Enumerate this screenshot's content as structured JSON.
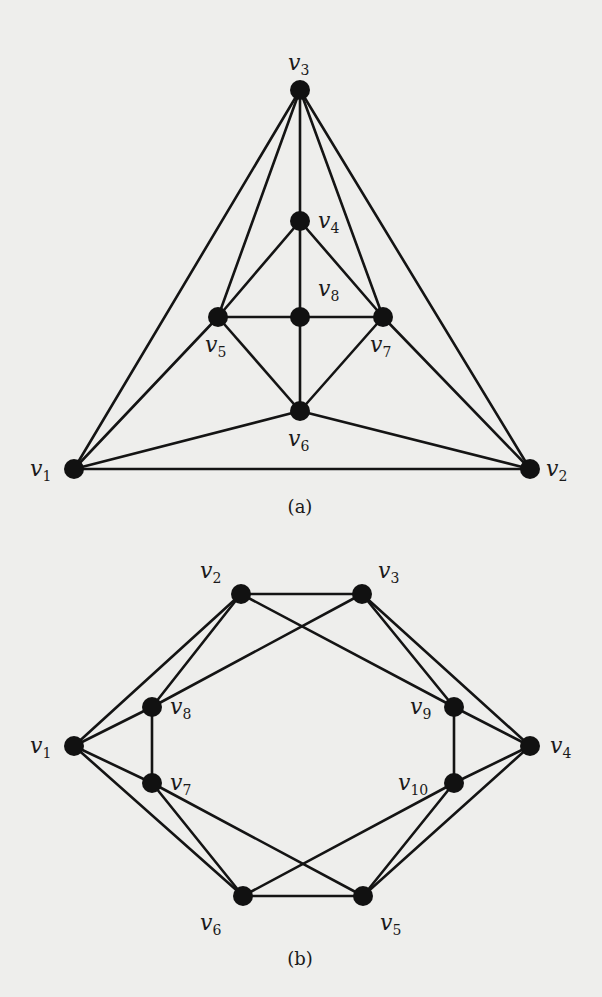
{
  "figure": {
    "background": "#eeeeec",
    "edge_color": "#141414",
    "node_color": "#111111",
    "node_radius": 10
  },
  "graphs": [
    {
      "id": "a",
      "caption": "(a)",
      "caption_pos": [
        300,
        513
      ],
      "nodes": [
        {
          "id": "v1",
          "name": "v",
          "sub": "1",
          "x": 74,
          "y": 469,
          "lx": 30,
          "ly": 476
        },
        {
          "id": "v2",
          "name": "v",
          "sub": "2",
          "x": 530,
          "y": 469,
          "lx": 546,
          "ly": 476
        },
        {
          "id": "v3",
          "name": "v",
          "sub": "3",
          "x": 300,
          "y": 90,
          "lx": 288,
          "ly": 70
        },
        {
          "id": "v4",
          "name": "v",
          "sub": "4",
          "x": 300,
          "y": 221,
          "lx": 318,
          "ly": 228
        },
        {
          "id": "v5",
          "name": "v",
          "sub": "5",
          "x": 218,
          "y": 317,
          "lx": 205,
          "ly": 352
        },
        {
          "id": "v6",
          "name": "v",
          "sub": "6",
          "x": 300,
          "y": 411,
          "lx": 288,
          "ly": 446
        },
        {
          "id": "v7",
          "name": "v",
          "sub": "7",
          "x": 383,
          "y": 317,
          "lx": 370,
          "ly": 352
        },
        {
          "id": "v8",
          "name": "v",
          "sub": "8",
          "x": 300,
          "y": 317,
          "lx": 318,
          "ly": 296
        }
      ],
      "edges": [
        [
          "v3",
          "v1"
        ],
        [
          "v3",
          "v5"
        ],
        [
          "v3",
          "v4"
        ],
        [
          "v3",
          "v7"
        ],
        [
          "v3",
          "v2"
        ],
        [
          "v4",
          "v5"
        ],
        [
          "v4",
          "v8"
        ],
        [
          "v4",
          "v7"
        ],
        [
          "v5",
          "v8"
        ],
        [
          "v8",
          "v7"
        ],
        [
          "v8",
          "v6"
        ],
        [
          "v5",
          "v6"
        ],
        [
          "v7",
          "v6"
        ],
        [
          "v5",
          "v1"
        ],
        [
          "v7",
          "v2"
        ],
        [
          "v6",
          "v1"
        ],
        [
          "v6",
          "v2"
        ],
        [
          "v1",
          "v2"
        ]
      ]
    },
    {
      "id": "b",
      "caption": "(b)",
      "caption_pos": [
        300,
        965
      ],
      "nodes": [
        {
          "id": "v1",
          "name": "v",
          "sub": "1",
          "x": 74,
          "y": 746,
          "lx": 30,
          "ly": 753
        },
        {
          "id": "v2",
          "name": "v",
          "sub": "2",
          "x": 241,
          "y": 594,
          "lx": 200,
          "ly": 578
        },
        {
          "id": "v3",
          "name": "v",
          "sub": "3",
          "x": 362,
          "y": 594,
          "lx": 378,
          "ly": 578
        },
        {
          "id": "v4",
          "name": "v",
          "sub": "4",
          "x": 530,
          "y": 746,
          "lx": 550,
          "ly": 753
        },
        {
          "id": "v5",
          "name": "v",
          "sub": "5",
          "x": 363,
          "y": 896,
          "lx": 380,
          "ly": 930
        },
        {
          "id": "v6",
          "name": "v",
          "sub": "6",
          "x": 243,
          "y": 896,
          "lx": 200,
          "ly": 930
        },
        {
          "id": "v7",
          "name": "v",
          "sub": "7",
          "x": 152,
          "y": 783,
          "lx": 170,
          "ly": 790
        },
        {
          "id": "v8",
          "name": "v",
          "sub": "8",
          "x": 152,
          "y": 707,
          "lx": 170,
          "ly": 714
        },
        {
          "id": "v9",
          "name": "v",
          "sub": "9",
          "x": 454,
          "y": 707,
          "lx": 410,
          "ly": 714
        },
        {
          "id": "v10",
          "name": "v",
          "sub": "10",
          "x": 454,
          "y": 783,
          "lx": 398,
          "ly": 790
        }
      ],
      "edges": [
        [
          "v2",
          "v3"
        ],
        [
          "v2",
          "v1"
        ],
        [
          "v2",
          "v8"
        ],
        [
          "v2",
          "v9"
        ],
        [
          "v3",
          "v8"
        ],
        [
          "v3",
          "v9"
        ],
        [
          "v3",
          "v4"
        ],
        [
          "v1",
          "v8"
        ],
        [
          "v1",
          "v7"
        ],
        [
          "v1",
          "v6"
        ],
        [
          "v8",
          "v7"
        ],
        [
          "v9",
          "v4"
        ],
        [
          "v9",
          "v10"
        ],
        [
          "v4",
          "v10"
        ],
        [
          "v4",
          "v5"
        ],
        [
          "v7",
          "v6"
        ],
        [
          "v7",
          "v5"
        ],
        [
          "v10",
          "v6"
        ],
        [
          "v10",
          "v5"
        ],
        [
          "v6",
          "v5"
        ]
      ]
    }
  ]
}
